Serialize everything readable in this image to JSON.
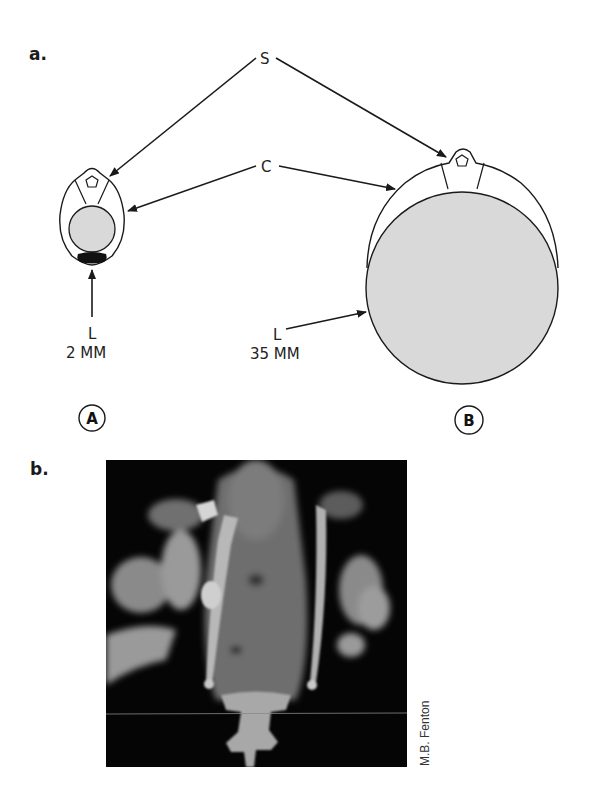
{
  "panels": {
    "a": {
      "label": "a.",
      "callouts": {
        "S": "S",
        "C": "C"
      },
      "specimen_A": {
        "badge": "A",
        "lumen_label": "L",
        "lumen_size": "2 MM"
      },
      "specimen_B": {
        "badge": "B",
        "lumen_label": "L",
        "lumen_size": "35 MM"
      }
    },
    "b": {
      "label": "b.",
      "photo_description": "Ventral view of bat skeleton showing vertebral column with attached ribs / bony structures",
      "credit": "M.B. Fenton"
    }
  },
  "colors": {
    "line": "#1a1a1a",
    "lumen_fill": "#d9d9d9",
    "dark_mass": "#111111",
    "photo_bg": "#050505"
  }
}
